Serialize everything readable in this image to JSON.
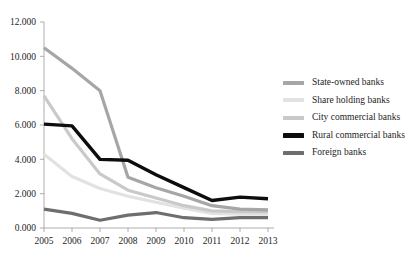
{
  "chart_data": {
    "type": "line",
    "title": "",
    "xlabel": "",
    "ylabel": "",
    "categories": [
      "2005",
      "2006",
      "2007",
      "2008",
      "2009",
      "2010",
      "2011",
      "2012",
      "2013"
    ],
    "ylim": [
      0,
      12
    ],
    "ytick_values": [
      0,
      2,
      4,
      6,
      8,
      10,
      12
    ],
    "ytick_labels": [
      "0.000",
      "2.000",
      "4.000",
      "6.000",
      "8.000",
      "10.000",
      "12.000"
    ],
    "grid": false,
    "legend_position": "right",
    "series": [
      {
        "name": "State-owned banks",
        "color": "#a6a6a6",
        "width": 3.2,
        "values": [
          10.5,
          9.3,
          8.0,
          2.95,
          2.35,
          1.85,
          1.3,
          1.1,
          1.05
        ]
      },
      {
        "name": "Share holding banks",
        "color": "#e2e2e2",
        "width": 3.2,
        "values": [
          4.3,
          3.0,
          2.3,
          1.85,
          1.5,
          1.15,
          0.85,
          0.8,
          0.8
        ]
      },
      {
        "name": "City commercial banks",
        "color": "#c9c9c9",
        "width": 3.2,
        "values": [
          7.7,
          5.2,
          3.15,
          2.2,
          1.75,
          1.3,
          1.0,
          0.95,
          0.95
        ]
      },
      {
        "name": "Rural commercial banks",
        "color": "#0d0d0d",
        "width": 3.4,
        "values": [
          6.05,
          5.95,
          4.0,
          3.95,
          3.1,
          2.35,
          1.6,
          1.8,
          1.7
        ]
      },
      {
        "name": "Foreign banks",
        "color": "#6e6e6e",
        "width": 3.2,
        "values": [
          1.1,
          0.85,
          0.45,
          0.75,
          0.9,
          0.6,
          0.5,
          0.6,
          0.6
        ]
      }
    ]
  },
  "legend": {
    "items": [
      {
        "label": "State-owned banks"
      },
      {
        "label": "Share holding banks"
      },
      {
        "label": "City commercial banks"
      },
      {
        "label": "Rural commercial banks"
      },
      {
        "label": "Foreign banks"
      }
    ]
  }
}
